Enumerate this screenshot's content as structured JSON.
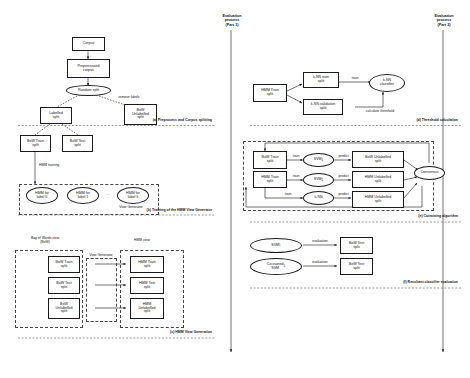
{
  "figure": {
    "type": "pipeline-flowchart",
    "panels": [
      {
        "id": "a",
        "caption": "(a) Preprocess and Corpus splitting"
      },
      {
        "id": "b",
        "caption": "(b) Training of the HMM View Generator"
      },
      {
        "id": "c",
        "caption": "(c) HMM View Generation"
      },
      {
        "id": "d",
        "caption": "(d) Threshold calculation"
      },
      {
        "id": "e",
        "caption": "(e) Cotraining algorithm"
      },
      {
        "id": "f",
        "caption": "(f) Resultant classifier evaluation"
      }
    ]
  },
  "spines": {
    "part1": "Evaluation\nprocess\n(Part 1)",
    "part2": "Evaluation\nprocess\n(Part 2)"
  },
  "panel_a": {
    "nodes": {
      "corpus": "Corpus",
      "preprocessed": "Preprocessed\ncorpus",
      "random_split": "Random split",
      "labelled": "Labelled\nsplit",
      "bow_unlabelled": "BoW\nUnlabelled\nsplit",
      "bow_train": "BoW Train\nsplit",
      "bow_test": "BoW Test\nsplit"
    },
    "edges": {
      "remove_labels": "remove labels"
    }
  },
  "panel_b": {
    "edges": {
      "hmm_training": "HMM training"
    },
    "nodes": {
      "hmm0": "HMM for\nlabel 0",
      "hmm1": "HMM for\nlabel 1",
      "ellipsis": "...",
      "hmmk": "HMM for\nlabel k"
    },
    "group_label": "View Generator"
  },
  "panel_c": {
    "headers": {
      "bow_view": "Bag of Words view\n(BoW)",
      "hmm_view": "HMM view",
      "view_generator": "View Generator"
    },
    "left": [
      "BoW Train\nsplit",
      "BoW Test\nsplit",
      "BoW\nUnlabelled\nsplit"
    ],
    "right": [
      "HMM Train\nsplit",
      "HMM Test\nsplit",
      "HMM\nUnlabelled\nsplit"
    ]
  },
  "panel_d": {
    "nodes": {
      "hmm_train": "HMM Train\nsplit",
      "knn_train": "k-NN train\nsplit",
      "knn_validation": "k-NN validation\nsplit",
      "knn_classifier": "k-NN\nclassifier"
    },
    "edges": {
      "train": "train",
      "calculate_threshold": "calculate threshold"
    }
  },
  "panel_e": {
    "nodes": {
      "bow_train": "BoW Train\nsplit",
      "hmm_train": "HMM Train\nsplit",
      "svm1": "SVM",
      "svm1_sub": "1",
      "svm2": "SVM",
      "svm2_sub": "2",
      "knn": "k-NN",
      "bow_unlabelled": "BoW Unlabelled\nsplit",
      "hmm_unlabelled_a": "HMM Unlabelled\nsplit",
      "hmm_unlabelled_b": "HMM Unlabelled\nsplit",
      "consensus": "Consensus"
    },
    "edges": {
      "train": "train",
      "predict": "predict"
    }
  },
  "panel_f": {
    "nodes": {
      "svm1": "SVM",
      "svm1_sub": "1",
      "cotrained_svm1": "Co-trained\nSVM",
      "cotrained_svm1_sub": "1",
      "bow_test_a": "BoW Test\nsplit",
      "bow_test_b": "BoW Test\nsplit"
    },
    "edges": {
      "evaluation": "evaluation"
    }
  }
}
